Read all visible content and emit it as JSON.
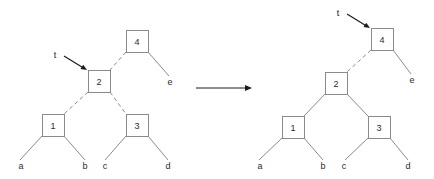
{
  "figure": {
    "colors": {
      "node_stroke": "#8a8a8a",
      "edge": "#8a8a8a",
      "text": "#2b2b2b",
      "pointer": "#1a1a1a",
      "background": "#ffffff"
    },
    "transition": {
      "name": "rightward transition arrow",
      "x1": 196,
      "y1": 88,
      "x2": 252,
      "y2": 88
    },
    "left_tree": {
      "caption": "before rotation",
      "pointer": {
        "label": "t",
        "label_x": 55,
        "label_y": 55,
        "arrow_x1": 64,
        "arrow_y1": 56,
        "arrow_x2": 87,
        "arrow_y2": 70,
        "target": "node-2"
      },
      "nodes": [
        {
          "id": "node-4",
          "label": "4",
          "x": 126,
          "y": 30,
          "w": 22,
          "h": 22
        },
        {
          "id": "node-2",
          "label": "2",
          "x": 88,
          "y": 70,
          "w": 22,
          "h": 22
        },
        {
          "id": "node-1",
          "label": "1",
          "x": 42,
          "y": 114,
          "w": 22,
          "h": 22
        },
        {
          "id": "node-3",
          "label": "3",
          "x": 126,
          "y": 114,
          "w": 22,
          "h": 22
        }
      ],
      "leaves": [
        {
          "id": "leaf-a",
          "label": "a",
          "x": 21,
          "y": 166
        },
        {
          "id": "leaf-b",
          "label": "b",
          "x": 85,
          "y": 166
        },
        {
          "id": "leaf-c",
          "label": "c",
          "x": 105,
          "y": 166
        },
        {
          "id": "leaf-d",
          "label": "d",
          "x": 168,
          "y": 166
        },
        {
          "id": "leaf-e",
          "label": "e",
          "x": 170,
          "y": 82
        }
      ],
      "edges": [
        {
          "id": "edge-4-2",
          "style": "dashed",
          "x1": 126,
          "y1": 52,
          "x2": 110,
          "y2": 70
        },
        {
          "id": "edge-4-e",
          "style": "solid",
          "x1": 148,
          "y1": 52,
          "x2": 169,
          "y2": 76
        },
        {
          "id": "edge-2-1",
          "style": "dashed",
          "x1": 88,
          "y1": 92,
          "x2": 64,
          "y2": 114
        },
        {
          "id": "edge-2-3",
          "style": "dashed",
          "x1": 110,
          "y1": 92,
          "x2": 126,
          "y2": 114
        },
        {
          "id": "edge-1-a",
          "style": "solid",
          "x1": 42,
          "y1": 136,
          "x2": 20,
          "y2": 160
        },
        {
          "id": "edge-1-b",
          "style": "solid",
          "x1": 64,
          "y1": 136,
          "x2": 85,
          "y2": 160
        },
        {
          "id": "edge-3-c",
          "style": "solid",
          "x1": 126,
          "y1": 136,
          "x2": 105,
          "y2": 160
        },
        {
          "id": "edge-3-d",
          "style": "solid",
          "x1": 148,
          "y1": 136,
          "x2": 168,
          "y2": 160
        }
      ]
    },
    "right_tree": {
      "caption": "after rotation",
      "pointer": {
        "label": "t",
        "label_x": 338,
        "label_y": 13,
        "arrow_x1": 347,
        "arrow_y1": 14,
        "arrow_x2": 370,
        "arrow_y2": 28,
        "target": "node-4"
      },
      "nodes": [
        {
          "id": "node-4",
          "label": "4",
          "x": 371,
          "y": 28,
          "w": 22,
          "h": 22
        },
        {
          "id": "node-2",
          "label": "2",
          "x": 325,
          "y": 72,
          "w": 22,
          "h": 22
        },
        {
          "id": "node-1",
          "label": "1",
          "x": 282,
          "y": 116,
          "w": 22,
          "h": 22
        },
        {
          "id": "node-3",
          "label": "3",
          "x": 368,
          "y": 116,
          "w": 22,
          "h": 22
        }
      ],
      "leaves": [
        {
          "id": "leaf-a",
          "label": "a",
          "x": 260,
          "y": 166
        },
        {
          "id": "leaf-b",
          "label": "b",
          "x": 323,
          "y": 166
        },
        {
          "id": "leaf-c",
          "label": "c",
          "x": 344,
          "y": 166
        },
        {
          "id": "leaf-d",
          "label": "d",
          "x": 408,
          "y": 166
        },
        {
          "id": "leaf-e",
          "label": "e",
          "x": 412,
          "y": 80
        }
      ],
      "edges": [
        {
          "id": "edge-4-2",
          "style": "dashed",
          "x1": 371,
          "y1": 50,
          "x2": 347,
          "y2": 72
        },
        {
          "id": "edge-4-e",
          "style": "solid",
          "x1": 393,
          "y1": 50,
          "x2": 411,
          "y2": 74
        },
        {
          "id": "edge-2-1",
          "style": "solid",
          "x1": 325,
          "y1": 94,
          "x2": 304,
          "y2": 116
        },
        {
          "id": "edge-2-3",
          "style": "solid",
          "x1": 347,
          "y1": 94,
          "x2": 368,
          "y2": 116
        },
        {
          "id": "edge-1-a",
          "style": "solid",
          "x1": 282,
          "y1": 138,
          "x2": 259,
          "y2": 160
        },
        {
          "id": "edge-1-b",
          "style": "solid",
          "x1": 304,
          "y1": 138,
          "x2": 323,
          "y2": 160
        },
        {
          "id": "edge-3-c",
          "style": "solid",
          "x1": 368,
          "y1": 138,
          "x2": 345,
          "y2": 160
        },
        {
          "id": "edge-3-d",
          "style": "solid",
          "x1": 390,
          "y1": 138,
          "x2": 408,
          "y2": 160
        }
      ]
    }
  }
}
